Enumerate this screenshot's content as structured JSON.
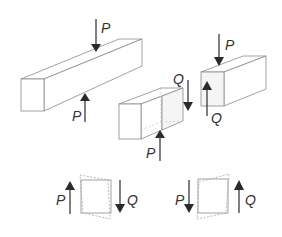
{
  "diagram": {
    "colors": {
      "line": "#8a8a8a",
      "arrow": "#2a2a2a",
      "label": "#333333",
      "dots": "#b0b0b0"
    },
    "beam": {
      "force_top_label": "P",
      "force_bottom_label": "P"
    },
    "left_segment": {
      "force_bottom_label": "P",
      "internal_force_label": "Q"
    },
    "right_segment": {
      "force_top_label": "P",
      "internal_force_label": "Q"
    },
    "element_left": {
      "force_left_label": "P",
      "force_right_label": "Q"
    },
    "element_right": {
      "force_left_label": "P",
      "force_right_label": "Q"
    }
  }
}
